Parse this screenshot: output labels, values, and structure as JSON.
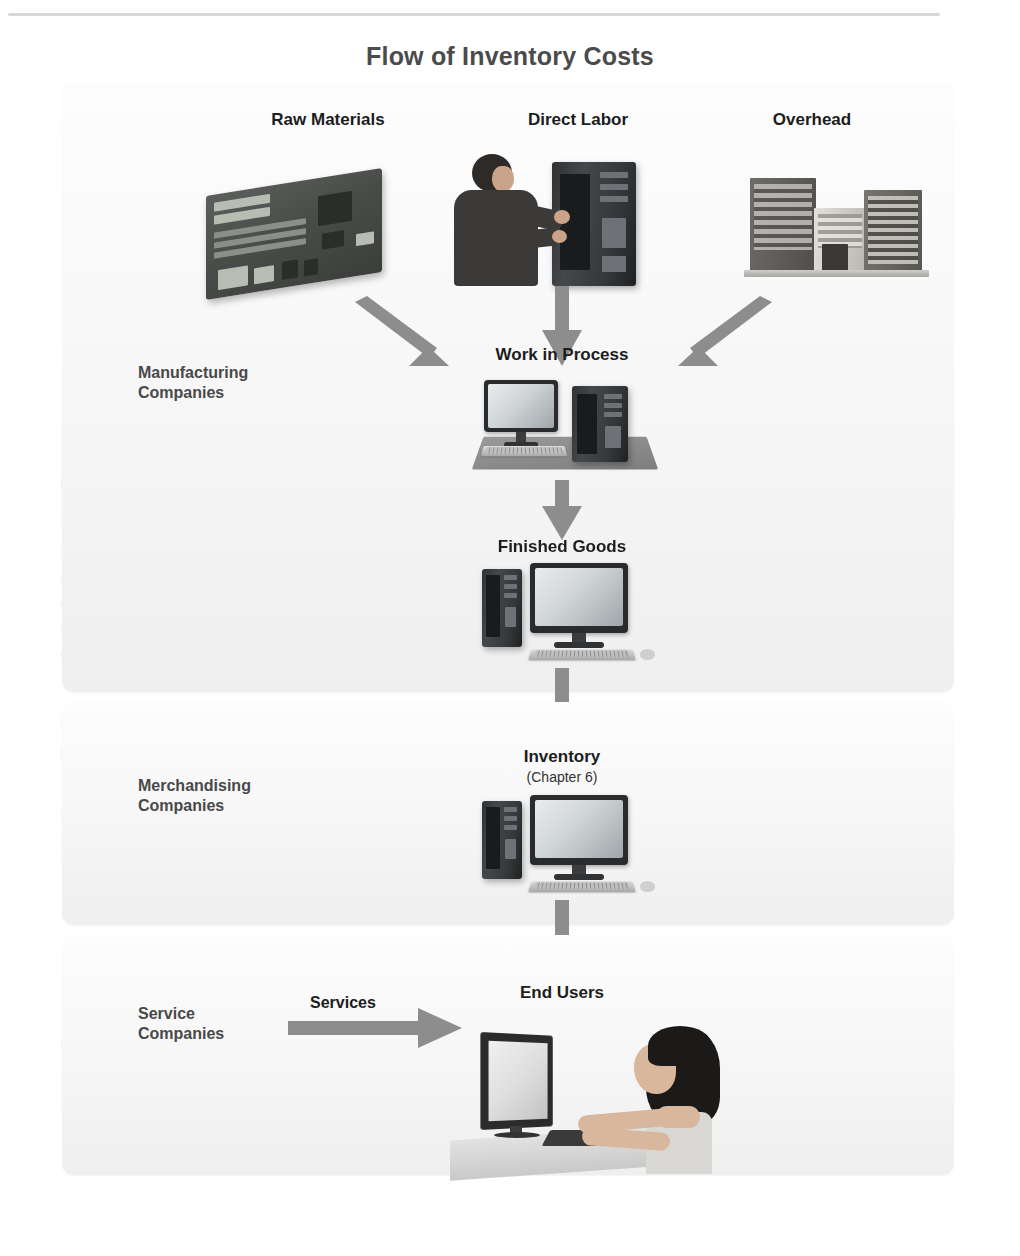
{
  "figure": {
    "title": "Flow of Inventory Costs",
    "top_rule": true
  },
  "inputs": {
    "raw_materials": "Raw Materials",
    "direct_labor": "Direct Labor",
    "overhead": "Overhead"
  },
  "stages": {
    "work_in_process": "Work in Process",
    "finished_goods": "Finished Goods",
    "inventory": "Inventory",
    "inventory_note": "(Chapter 6)",
    "end_users": "End Users"
  },
  "company_types": {
    "manufacturing": "Manufacturing\nCompanies",
    "manufacturing_line1": "Manufacturing",
    "manufacturing_line2": "Companies",
    "merchandising_line1": "Merchandising",
    "merchandising_line2": "Companies",
    "service_line1": "Service",
    "service_line2": "Companies"
  },
  "flow_labels": {
    "services": "Services",
    "products": "Products"
  },
  "illustration_names": {
    "raw_materials": "circuit-board-image",
    "direct_labor": "worker-assembling-computer-image",
    "overhead": "factory-building-image",
    "work_in_process": "computer-on-workbench-image",
    "finished_goods": "finished-computer-image",
    "inventory": "inventory-computer-image",
    "end_users": "person-using-computer-image"
  },
  "colors": {
    "title": "#4b4b4b",
    "label": "#1d1d1d",
    "side_label": "#494949",
    "arrow": "#8d8d8d",
    "panel_bg": "#f6f6f6",
    "page_bg": "#ffffff",
    "rule": "#d8d8d8"
  },
  "bleed_text": [
    "in a manufacturing company",
    "the merchandise inventory",
    "Supplies and Materials",
    "physical goods that",
    "KEY POINT"
  ]
}
